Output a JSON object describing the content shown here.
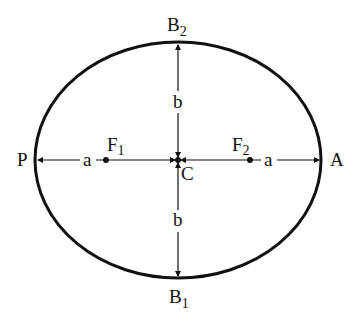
{
  "diagram": {
    "colors": {
      "stroke": "#111111",
      "background": "#ffffff"
    },
    "ellipse": {
      "cx": 178,
      "cy": 160,
      "rx": 143,
      "ry": 118
    },
    "labels": {
      "top_vertex": {
        "main": "B",
        "sub": "2"
      },
      "bottom_vertex": {
        "main": "B",
        "sub": "1"
      },
      "left_vertex": "P",
      "right_vertex": "A",
      "center": "C",
      "focus_left": {
        "main": "F",
        "sub": "1"
      },
      "focus_right": {
        "main": "F",
        "sub": "2"
      },
      "semi_major_left": "a",
      "semi_major_right": "a",
      "semi_minor_top": "b",
      "semi_minor_bottom": "b"
    }
  }
}
